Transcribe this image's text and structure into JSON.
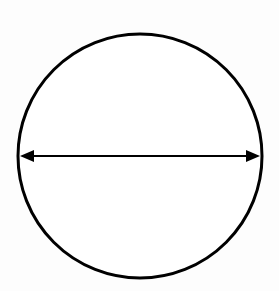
{
  "diagram": {
    "type": "circle-diameter",
    "circle": {
      "cx": 140,
      "cy": 156,
      "r": 122,
      "stroke": "#000000",
      "stroke_width": 3,
      "fill": "#ffffff"
    },
    "diameter_arrow": {
      "x1": 20,
      "y1": 156,
      "x2": 260,
      "y2": 156,
      "stroke": "#000000",
      "stroke_width": 2,
      "heads": "both"
    },
    "background": "#fdfdfd"
  }
}
